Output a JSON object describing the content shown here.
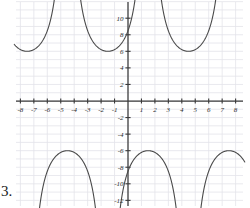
{
  "problem": {
    "number_label": "3."
  },
  "chart_data": {
    "type": "line",
    "title": "",
    "xlabel": "",
    "ylabel": "",
    "xlim": [
      -8.6,
      8.6
    ],
    "ylim": [
      -12.6,
      12.6
    ],
    "grid": true,
    "grid_step_x": 1,
    "grid_step_y": 1,
    "legend": "none",
    "axis_color": "#3a3a3a",
    "grid_color": "#e3e3ea",
    "curve_color": "#4a4a4a",
    "x_tick_labels": [
      "-8",
      "-7",
      "-6",
      "-5",
      "-4",
      "-3",
      "-2",
      "-1",
      "1",
      "2",
      "3",
      "4",
      "5",
      "6",
      "7",
      "8"
    ],
    "x_tick_values": [
      -8,
      -7,
      -6,
      -5,
      -4,
      -3,
      -2,
      -1,
      1,
      2,
      3,
      4,
      5,
      6,
      7,
      8
    ],
    "y_tick_labels": [
      "12",
      "10",
      "8",
      "6",
      "4",
      "2",
      "-2",
      "-4",
      "-6",
      "-8",
      "-10",
      "-12"
    ],
    "y_tick_values": [
      12,
      10,
      8,
      6,
      4,
      2,
      -2,
      -4,
      -6,
      -8,
      -10,
      -12
    ],
    "function_description": "periodic secant-like curve, period 6, amplitude 6",
    "period": 6,
    "upper_branch_minimum": 6,
    "lower_branch_maximum": -6,
    "upper_branch_vertices_x": [
      -7.5,
      -1.5,
      4.5
    ],
    "lower_branch_vertices_x": [
      -4.5,
      1.5,
      7.5
    ],
    "asymptotes_x": [
      -9,
      -6,
      -3,
      0,
      3,
      6,
      9
    ],
    "series": [
      {
        "name": "y = 6 sec(pi x / 3)",
        "branches": [
          {
            "vertex_x": -7.5,
            "vertex_y": 6,
            "direction": "up"
          },
          {
            "vertex_x": -4.5,
            "vertex_y": -6,
            "direction": "down"
          },
          {
            "vertex_x": -1.5,
            "vertex_y": 6,
            "direction": "up"
          },
          {
            "vertex_x": 1.5,
            "vertex_y": -6,
            "direction": "down"
          },
          {
            "vertex_x": 4.5,
            "vertex_y": 6,
            "direction": "up"
          },
          {
            "vertex_x": 7.5,
            "vertex_y": -6,
            "direction": "down"
          }
        ]
      }
    ]
  }
}
